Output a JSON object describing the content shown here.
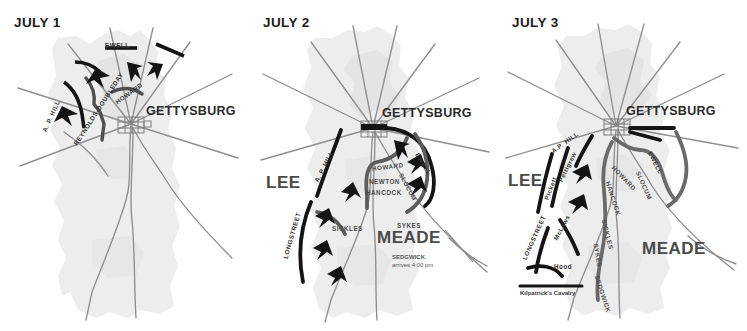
{
  "figure": {
    "kind": "battle-map-series",
    "title_visible": false,
    "panel_count": 3
  },
  "style": {
    "page_background": "#ffffff",
    "terrain_fill": "#e9e9e9",
    "terrain_fill_light": "#f1f1f1",
    "road_color": "#8e8e93",
    "troop_line_confederate": "#1a1a1a",
    "troop_line_union": "#6e6e6e",
    "arrow_color": "#1a1a1a",
    "title_color": "#1b1b1b",
    "army_label_color": "#4a4a4a",
    "town_grid_color": "#7b7b7b"
  },
  "panels": [
    {
      "id": "july-1",
      "title": "JULY 1",
      "town_label": "GETTYSBURG",
      "army_labels": [],
      "commanders": [
        {
          "name": "EWELL",
          "side": "confederate",
          "orientation": "horizontal"
        },
        {
          "name": "A. P. HILL",
          "side": "confederate",
          "orientation": "rotated"
        },
        {
          "name": "REYNOLDS-DOUBLEDAY",
          "side": "union",
          "orientation": "rotated"
        },
        {
          "name": "HOWARD",
          "side": "union",
          "orientation": "rotated"
        }
      ],
      "notes": []
    },
    {
      "id": "july-2",
      "title": "JULY 2",
      "town_label": "GETTYSBURG",
      "army_labels": [
        "LEE",
        "MEADE"
      ],
      "commanders": [
        {
          "name": "A. P. HILL",
          "side": "confederate",
          "orientation": "rotated"
        },
        {
          "name": "LONGSTREET",
          "side": "confederate",
          "orientation": "rotated"
        },
        {
          "name": "EWELL",
          "side": "confederate",
          "orientation": "rotated"
        },
        {
          "name": "HOWARD",
          "side": "union",
          "orientation": "rotated"
        },
        {
          "name": "NEWTON",
          "side": "union",
          "orientation": "horizontal"
        },
        {
          "name": "HANCOCK",
          "side": "union",
          "orientation": "horizontal"
        },
        {
          "name": "SLOCUM",
          "side": "union",
          "orientation": "rotated"
        },
        {
          "name": "SICKLES",
          "side": "union",
          "orientation": "horizontal"
        },
        {
          "name": "SYKES",
          "side": "union",
          "orientation": "horizontal"
        }
      ],
      "notes": [
        {
          "name": "SEDGWICK",
          "detail": "arrives 4:00 pm"
        }
      ]
    },
    {
      "id": "july-3",
      "title": "JULY 3",
      "town_label": "GETTYSBURG",
      "army_labels": [
        "LEE",
        "MEADE"
      ],
      "commanders": [
        {
          "name": "A.P. HILL",
          "side": "confederate",
          "orientation": "rotated"
        },
        {
          "name": "EWELL",
          "side": "confederate",
          "orientation": "rotated"
        },
        {
          "name": "Pickett",
          "side": "confederate",
          "orientation": "rotated"
        },
        {
          "name": "Pettigrew",
          "side": "confederate",
          "orientation": "rotated"
        },
        {
          "name": "LONGSTREET",
          "side": "confederate",
          "orientation": "rotated"
        },
        {
          "name": "McLaws",
          "side": "confederate",
          "orientation": "rotated"
        },
        {
          "name": "Hood",
          "side": "confederate",
          "orientation": "horizontal"
        },
        {
          "name": "HOWARD",
          "side": "union",
          "orientation": "rotated"
        },
        {
          "name": "SLOCUM",
          "side": "union",
          "orientation": "rotated"
        },
        {
          "name": "HANCOCK",
          "side": "union",
          "orientation": "rotated"
        },
        {
          "name": "SICKLES",
          "side": "union",
          "orientation": "rotated"
        },
        {
          "name": "SYKES",
          "side": "union",
          "orientation": "rotated"
        },
        {
          "name": "SEDGWICK",
          "side": "union",
          "orientation": "rotated"
        }
      ],
      "notes": [
        {
          "name": "Kilpatrick's Cavalry",
          "detail": ""
        }
      ]
    }
  ]
}
